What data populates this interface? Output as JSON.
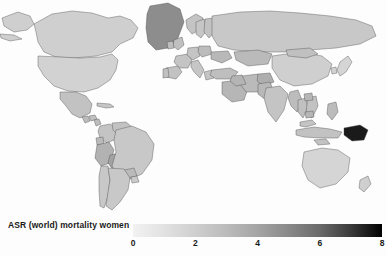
{
  "legend": {
    "title": "ASR (world) mortality women",
    "ticks": [
      "0",
      "2",
      "4",
      "6",
      "8"
    ],
    "tick_values": [
      0,
      2,
      4,
      6,
      8
    ],
    "gradient_start_color": "#f2f2f2",
    "gradient_end_color": "#000000"
  },
  "chart_data": {
    "type": "heatmap",
    "subtype": "choropleth-world-map",
    "title": "",
    "subtitle": "",
    "xlabel": "",
    "ylabel": "",
    "legend_title": "ASR (world) mortality women",
    "legend_position": "bottom",
    "grid": false,
    "colorscale": "grayscale-light-to-dark",
    "vmin": 0,
    "vmax": 8,
    "tick_labels": [
      "0",
      "2",
      "4",
      "6",
      "8"
    ],
    "tick_values": [
      0,
      2,
      4,
      6,
      8
    ],
    "ocean_color": "#fdfdfd",
    "border_color": "#4a4a4a",
    "regions": [
      {
        "name": "Greenland",
        "value": 5.4,
        "color": "#8d8d8d"
      },
      {
        "name": "Canada",
        "value": 1.7,
        "color": "#cfcfcf"
      },
      {
        "name": "Alaska",
        "value": 1.7,
        "color": "#cfcfcf"
      },
      {
        "name": "United States",
        "value": 1.6,
        "color": "#d2d2d2"
      },
      {
        "name": "Mexico",
        "value": 2.3,
        "color": "#c2c2c2"
      },
      {
        "name": "Guatemala",
        "value": 2.6,
        "color": "#bcbcbc"
      },
      {
        "name": "Honduras",
        "value": 2.4,
        "color": "#c0c0c0"
      },
      {
        "name": "Nicaragua",
        "value": 2.5,
        "color": "#bebebe"
      },
      {
        "name": "Cuba",
        "value": 2.1,
        "color": "#c6c6c6"
      },
      {
        "name": "Colombia",
        "value": 2.2,
        "color": "#c4c4c4"
      },
      {
        "name": "Venezuela",
        "value": 2.3,
        "color": "#c2c2c2"
      },
      {
        "name": "Ecuador",
        "value": 2.7,
        "color": "#bababa"
      },
      {
        "name": "Peru",
        "value": 3.1,
        "color": "#b2b2b2"
      },
      {
        "name": "Bolivia",
        "value": 3.8,
        "color": "#a2a2a2"
      },
      {
        "name": "Brazil",
        "value": 2.0,
        "color": "#c8c8c8"
      },
      {
        "name": "Paraguay",
        "value": 2.7,
        "color": "#bababa"
      },
      {
        "name": "Chile",
        "value": 2.0,
        "color": "#c8c8c8"
      },
      {
        "name": "Argentina",
        "value": 2.0,
        "color": "#c8c8c8"
      },
      {
        "name": "Uruguay",
        "value": 1.9,
        "color": "#cacaca"
      },
      {
        "name": "Morocco",
        "value": 2.6,
        "color": "#bcbcbc"
      },
      {
        "name": "Algeria",
        "value": 2.4,
        "color": "#c0c0c0"
      },
      {
        "name": "Libya",
        "value": 2.5,
        "color": "#bebebe"
      },
      {
        "name": "Egypt",
        "value": 2.8,
        "color": "#b8b8b8"
      },
      {
        "name": "Sudan",
        "value": 3.0,
        "color": "#b4b4b4"
      },
      {
        "name": "Ethiopia",
        "value": 4.6,
        "color": "#929292"
      },
      {
        "name": "Somalia",
        "value": 3.6,
        "color": "#a6a6a6"
      },
      {
        "name": "Kenya",
        "value": 3.2,
        "color": "#b0b0b0"
      },
      {
        "name": "Tanzania",
        "value": 3.1,
        "color": "#b2b2b2"
      },
      {
        "name": "Nigeria",
        "value": 2.9,
        "color": "#b6b6b6"
      },
      {
        "name": "Niger",
        "value": 2.8,
        "color": "#b8b8b8"
      },
      {
        "name": "Mali",
        "value": 2.8,
        "color": "#b8b8b8"
      },
      {
        "name": "Chad",
        "value": 3.0,
        "color": "#b4b4b4"
      },
      {
        "name": "Democratic Republic of the Congo",
        "value": 3.0,
        "color": "#b4b4b4"
      },
      {
        "name": "Angola",
        "value": 3.1,
        "color": "#b2b2b2"
      },
      {
        "name": "Zambia",
        "value": 3.2,
        "color": "#b0b0b0"
      },
      {
        "name": "Mozambique",
        "value": 3.3,
        "color": "#aeaeae"
      },
      {
        "name": "Madagascar",
        "value": 3.2,
        "color": "#b0b0b0"
      },
      {
        "name": "South Africa",
        "value": 2.9,
        "color": "#b6b6b6"
      },
      {
        "name": "Namibia",
        "value": 3.0,
        "color": "#b4b4b4"
      },
      {
        "name": "Zimbabwe",
        "value": 3.4,
        "color": "#ababab"
      },
      {
        "name": "Norway",
        "value": 2.2,
        "color": "#c4c4c4"
      },
      {
        "name": "Sweden",
        "value": 2.1,
        "color": "#c6c6c6"
      },
      {
        "name": "Finland",
        "value": 2.3,
        "color": "#c2c2c2"
      },
      {
        "name": "United Kingdom",
        "value": 2.4,
        "color": "#c0c0c0"
      },
      {
        "name": "Ireland",
        "value": 2.5,
        "color": "#bebebe"
      },
      {
        "name": "France",
        "value": 2.2,
        "color": "#c4c4c4"
      },
      {
        "name": "Spain",
        "value": 2.3,
        "color": "#c2c2c2"
      },
      {
        "name": "Portugal",
        "value": 2.4,
        "color": "#c0c0c0"
      },
      {
        "name": "Germany",
        "value": 2.2,
        "color": "#c4c4c4"
      },
      {
        "name": "Poland",
        "value": 2.6,
        "color": "#bcbcbc"
      },
      {
        "name": "Italy",
        "value": 2.1,
        "color": "#c6c6c6"
      },
      {
        "name": "Greece",
        "value": 2.2,
        "color": "#c4c4c4"
      },
      {
        "name": "Turkey",
        "value": 2.5,
        "color": "#bebebe"
      },
      {
        "name": "Ukraine",
        "value": 2.8,
        "color": "#b8b8b8"
      },
      {
        "name": "Russia",
        "value": 2.0,
        "color": "#c8c8c8"
      },
      {
        "name": "Kazakhstan",
        "value": 2.7,
        "color": "#bababa"
      },
      {
        "name": "Saudi Arabia",
        "value": 2.9,
        "color": "#b6b6b6"
      },
      {
        "name": "Iran",
        "value": 2.7,
        "color": "#bababa"
      },
      {
        "name": "Iraq",
        "value": 3.0,
        "color": "#b4b4b4"
      },
      {
        "name": "Afghanistan",
        "value": 3.3,
        "color": "#aeaeae"
      },
      {
        "name": "Pakistan",
        "value": 2.8,
        "color": "#b8b8b8"
      },
      {
        "name": "India",
        "value": 2.2,
        "color": "#c4c4c4"
      },
      {
        "name": "China",
        "value": 1.7,
        "color": "#cfcfcf"
      },
      {
        "name": "Mongolia",
        "value": 2.4,
        "color": "#c0c0c0"
      },
      {
        "name": "Japan",
        "value": 1.5,
        "color": "#d5d5d5"
      },
      {
        "name": "South Korea",
        "value": 1.6,
        "color": "#d2d2d2"
      },
      {
        "name": "Myanmar",
        "value": 2.6,
        "color": "#bcbcbc"
      },
      {
        "name": "Thailand",
        "value": 2.4,
        "color": "#c0c0c0"
      },
      {
        "name": "Vietnam",
        "value": 2.3,
        "color": "#c2c2c2"
      },
      {
        "name": "Laos",
        "value": 2.9,
        "color": "#b6b6b6"
      },
      {
        "name": "Cambodia",
        "value": 2.9,
        "color": "#b6b6b6"
      },
      {
        "name": "Malaysia",
        "value": 2.2,
        "color": "#c4c4c4"
      },
      {
        "name": "Indonesia",
        "value": 2.3,
        "color": "#c2c2c2"
      },
      {
        "name": "Philippines",
        "value": 2.6,
        "color": "#bcbcbc"
      },
      {
        "name": "Papua New Guinea",
        "value": 7.8,
        "color": "#1a1a1a"
      },
      {
        "name": "Australia",
        "value": 1.5,
        "color": "#d5d5d5"
      },
      {
        "name": "New Zealand",
        "value": 1.7,
        "color": "#cfcfcf"
      }
    ]
  }
}
